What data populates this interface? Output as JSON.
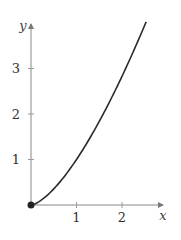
{
  "chart_data": {
    "type": "line",
    "title": "",
    "xlabel": "x",
    "ylabel": "y",
    "xlim": [
      0,
      2.9
    ],
    "ylim": [
      0,
      4.0
    ],
    "x_ticks": [
      "1",
      "2"
    ],
    "y_ticks": [
      "1",
      "2",
      "3"
    ],
    "grid": false,
    "legend": null,
    "series": [
      {
        "name": "y = x^(3/2)",
        "x": [
          0,
          0.25,
          0.5,
          0.75,
          1.0,
          1.25,
          1.5,
          1.75,
          2.0,
          2.25,
          2.53
        ],
        "values": [
          0,
          0.125,
          0.354,
          0.65,
          1.0,
          1.4,
          1.84,
          2.32,
          2.83,
          3.38,
          4.02
        ]
      }
    ],
    "annotations": [
      {
        "type": "point",
        "x": 0,
        "y": 0,
        "style": "filled-dot"
      }
    ]
  },
  "axes": {
    "x_label": "x",
    "y_label": "y",
    "x_tick_labels": [
      "1",
      "2"
    ],
    "y_tick_labels": [
      "1",
      "2",
      "3"
    ]
  },
  "colors": {
    "curve": "#2a2a2a",
    "axis": "#888888",
    "text": "#333333"
  }
}
